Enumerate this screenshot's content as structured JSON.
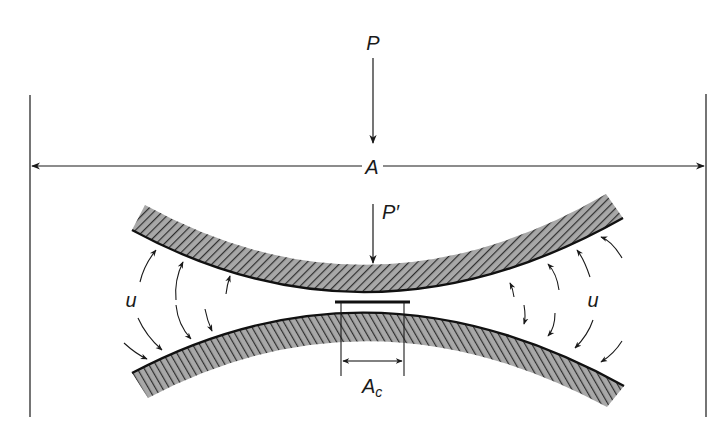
{
  "diagram": {
    "labels": {
      "load": "P",
      "apparent_area": "A",
      "local_load": "P′",
      "contact_area_main": "A",
      "contact_area_sub": "c",
      "field_left": "u",
      "field_right": "u"
    },
    "colors": {
      "line": "#1a1a1a",
      "hatch_fill": "#9a9a9a",
      "hatch_line": "#2a2a2a",
      "background": "#ffffff"
    },
    "elements": [
      "apparent-area-boundary-left",
      "apparent-area-boundary-right",
      "apparent-area-dimension-arrow",
      "load-arrow",
      "local-load-arrow",
      "upper-curved-plate",
      "lower-curved-plate",
      "contact-area-dimension",
      "field-arrows-left",
      "field-arrows-right"
    ]
  }
}
